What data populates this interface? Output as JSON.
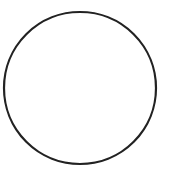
{
  "figure": {
    "shape": "circle",
    "stroke_color": "#222222",
    "fill_color": "#ffffff",
    "background": "#ffffff"
  }
}
